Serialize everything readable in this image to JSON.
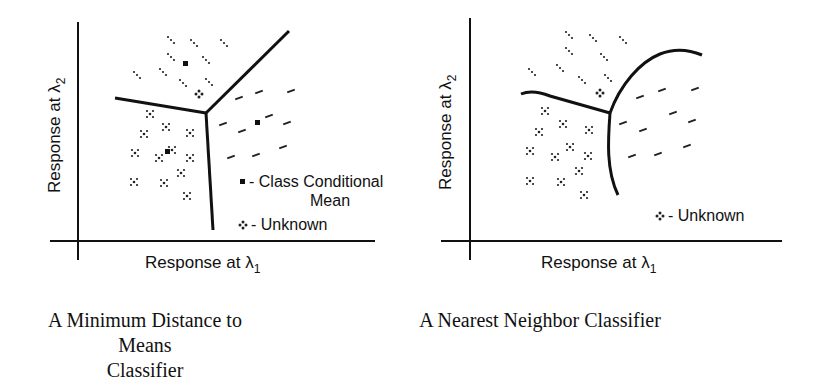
{
  "panels": [
    {
      "id": "min-distance",
      "caption_line1": "A Minimum Distance to Means",
      "caption_line2": "Classifier",
      "xlabel": "Response at λ",
      "xlabel_sub": "1",
      "ylabel": "Response at λ",
      "ylabel_sub": "2",
      "legend": {
        "mean_label": "- Class Conditional",
        "mean_label2": "Mean",
        "unknown_label": "- Unknown"
      }
    },
    {
      "id": "nearest-neighbor",
      "caption_line1": "A Nearest Neighbor Classifier",
      "xlabel": "Response at λ",
      "xlabel_sub": "1",
      "ylabel": "Response at λ",
      "ylabel_sub": "2",
      "legend": {
        "unknown_label": "- Unknown"
      }
    }
  ],
  "colors": {
    "ink": "#111111",
    "background": "#ffffff"
  }
}
